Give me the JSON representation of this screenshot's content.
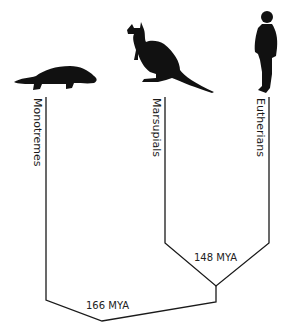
{
  "diagram": {
    "type": "phylogenetic-tree",
    "taxa": [
      {
        "label": "Monotremes",
        "silhouette": "platypus"
      },
      {
        "label": "Marsupials",
        "silhouette": "kangaroo"
      },
      {
        "label": "Eutherians",
        "silhouette": "human"
      }
    ],
    "nodes": [
      {
        "label": "148 MYA",
        "joins": [
          "Marsupials",
          "Eutherians"
        ]
      },
      {
        "label": "166 MYA",
        "joins": [
          "Monotremes",
          "Marsupials+Eutherians"
        ]
      }
    ],
    "line_color": "#1a1a1a"
  }
}
